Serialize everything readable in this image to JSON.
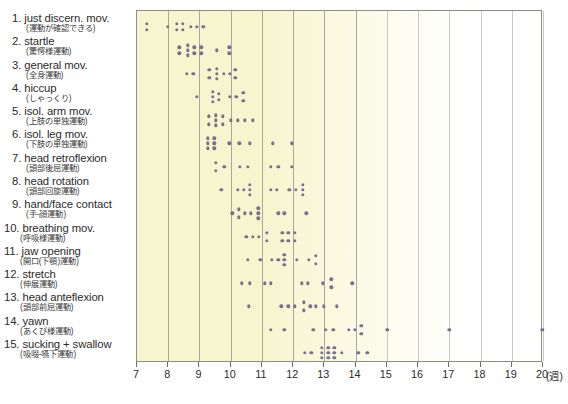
{
  "chart_data": {
    "type": "scatter",
    "title": "",
    "xlabel": "(週)",
    "ylabel": "",
    "xlim": [
      7,
      20
    ],
    "ylim": [
      0,
      16
    ],
    "grid": true,
    "legend": "none",
    "xticks": [
      7,
      8,
      9,
      10,
      11,
      12,
      13,
      14,
      15,
      16,
      17,
      18,
      19,
      20
    ],
    "x_unit_label": "(週)",
    "dot_color": "#7a6f8e",
    "plot_background": "#f7f5ce",
    "categories": [
      "1. just discern. mov.",
      "2. startle",
      "3. general mov.",
      "4. hiccup",
      "5. isol. arm mov.",
      "6. isol. leg mov.",
      "7. head retroflexion",
      "8. head rotation",
      "9. hand/face contact",
      "10. breathing mov.",
      "11. jaw opening",
      "12. stretch",
      "13. head anteflexion",
      "14. yawn",
      "15. sucking + swallow"
    ],
    "series": [
      {
        "name": "1. just discern. mov.",
        "jp": "(運動が確認できる)",
        "points": [
          {
            "x": 7.32,
            "o": -3
          },
          {
            "x": 7.32,
            "o": 3
          },
          {
            "x": 7.98,
            "o": 0
          },
          {
            "x": 8.28,
            "o": -3
          },
          {
            "x": 8.28,
            "o": 3
          },
          {
            "x": 8.47,
            "o": -3
          },
          {
            "x": 8.47,
            "o": 3
          },
          {
            "x": 8.72,
            "o": 0
          },
          {
            "x": 8.92,
            "o": 0
          },
          {
            "x": 9.12,
            "o": 0
          }
        ]
      },
      {
        "name": "2. startle",
        "jp": "(驚愕様運動)",
        "points": [
          {
            "x": 8.36,
            "o": -3
          },
          {
            "x": 8.36,
            "o": 3
          },
          {
            "x": 8.62,
            "o": -5
          },
          {
            "x": 8.62,
            "o": 0
          },
          {
            "x": 8.62,
            "o": 5
          },
          {
            "x": 8.84,
            "o": -3
          },
          {
            "x": 8.84,
            "o": 3
          },
          {
            "x": 9.06,
            "o": -3
          },
          {
            "x": 9.06,
            "o": 3
          },
          {
            "x": 9.55,
            "o": 0
          },
          {
            "x": 9.95,
            "o": -3
          },
          {
            "x": 9.95,
            "o": 3
          }
        ]
      },
      {
        "name": "3. general mov.",
        "jp": "(全身運動)",
        "points": [
          {
            "x": 8.6,
            "o": 0
          },
          {
            "x": 8.8,
            "o": 0
          },
          {
            "x": 9.32,
            "o": -4
          },
          {
            "x": 9.32,
            "o": 4
          },
          {
            "x": 9.55,
            "o": -5
          },
          {
            "x": 9.55,
            "o": 0
          },
          {
            "x": 9.55,
            "o": 5
          },
          {
            "x": 9.78,
            "o": 0
          },
          {
            "x": 9.98,
            "o": 0
          },
          {
            "x": 10.15,
            "o": -4
          },
          {
            "x": 10.15,
            "o": 4
          }
        ]
      },
      {
        "name": "4. hiccup",
        "jp": "(しゃっくり)",
        "points": [
          {
            "x": 8.92,
            "o": 0
          },
          {
            "x": 9.42,
            "o": -5
          },
          {
            "x": 9.42,
            "o": 0
          },
          {
            "x": 9.42,
            "o": 5
          },
          {
            "x": 9.62,
            "o": -3
          },
          {
            "x": 9.62,
            "o": 3
          },
          {
            "x": 9.98,
            "o": 0
          },
          {
            "x": 10.18,
            "o": 0
          },
          {
            "x": 10.4,
            "o": -4
          },
          {
            "x": 10.4,
            "o": 4
          }
        ]
      },
      {
        "name": "5. isol. arm mov.",
        "jp": "(上肢の単独運動)",
        "points": [
          {
            "x": 9.3,
            "o": -4
          },
          {
            "x": 9.3,
            "o": 4
          },
          {
            "x": 9.52,
            "o": -5
          },
          {
            "x": 9.52,
            "o": 0
          },
          {
            "x": 9.52,
            "o": 5
          },
          {
            "x": 9.74,
            "o": -4
          },
          {
            "x": 9.74,
            "o": 4
          },
          {
            "x": 10.0,
            "o": 0
          },
          {
            "x": 10.22,
            "o": 0
          },
          {
            "x": 10.46,
            "o": 0
          },
          {
            "x": 10.7,
            "o": 0
          }
        ]
      },
      {
        "name": "6. isol. leg mov.",
        "jp": "(下肢の単独運動)",
        "points": [
          {
            "x": 9.26,
            "o": -5
          },
          {
            "x": 9.26,
            "o": 0
          },
          {
            "x": 9.26,
            "o": 5
          },
          {
            "x": 9.48,
            "o": -5
          },
          {
            "x": 9.48,
            "o": 0
          },
          {
            "x": 9.48,
            "o": 5
          },
          {
            "x": 9.96,
            "o": 0
          },
          {
            "x": 10.28,
            "o": 0
          },
          {
            "x": 10.62,
            "o": 0
          },
          {
            "x": 11.35,
            "o": 0
          },
          {
            "x": 11.95,
            "o": 0
          }
        ]
      },
      {
        "name": "7. head retroflexion",
        "jp": "(頭部後屈運動)",
        "points": [
          {
            "x": 9.52,
            "o": -4
          },
          {
            "x": 9.52,
            "o": 4
          },
          {
            "x": 9.8,
            "o": 0
          },
          {
            "x": 10.3,
            "o": 0
          },
          {
            "x": 10.55,
            "o": 0
          },
          {
            "x": 11.28,
            "o": 0
          },
          {
            "x": 11.52,
            "o": 0
          },
          {
            "x": 11.95,
            "o": 0
          }
        ]
      },
      {
        "name": "8. head rotation",
        "jp": "(頭部回旋運動)",
        "points": [
          {
            "x": 9.7,
            "o": 0
          },
          {
            "x": 10.22,
            "o": 0
          },
          {
            "x": 10.42,
            "o": 0
          },
          {
            "x": 10.62,
            "o": -5
          },
          {
            "x": 10.62,
            "o": 0
          },
          {
            "x": 10.62,
            "o": 5
          },
          {
            "x": 11.28,
            "o": 0
          },
          {
            "x": 11.48,
            "o": 0
          },
          {
            "x": 11.88,
            "o": 0
          },
          {
            "x": 12.08,
            "o": 0
          },
          {
            "x": 12.3,
            "o": -5
          },
          {
            "x": 12.3,
            "o": 0
          },
          {
            "x": 12.3,
            "o": 5
          }
        ]
      },
      {
        "name": "9. hand/face contact",
        "jp": "(手-顔運動)",
        "points": [
          {
            "x": 10.05,
            "o": 0
          },
          {
            "x": 10.25,
            "o": -4
          },
          {
            "x": 10.25,
            "o": 4
          },
          {
            "x": 10.45,
            "o": 0
          },
          {
            "x": 10.65,
            "o": 0
          },
          {
            "x": 10.88,
            "o": -5
          },
          {
            "x": 10.88,
            "o": 0
          },
          {
            "x": 10.88,
            "o": 5
          },
          {
            "x": 11.52,
            "o": 0
          },
          {
            "x": 11.72,
            "o": 0
          },
          {
            "x": 12.42,
            "o": 0
          }
        ]
      },
      {
        "name": "10. breathing mov.",
        "jp": "(呼吸様運動)",
        "points": [
          {
            "x": 10.5,
            "o": 0
          },
          {
            "x": 10.7,
            "o": 0
          },
          {
            "x": 10.9,
            "o": 0
          },
          {
            "x": 11.15,
            "o": -4
          },
          {
            "x": 11.15,
            "o": 4
          },
          {
            "x": 11.65,
            "o": -4
          },
          {
            "x": 11.65,
            "o": 4
          },
          {
            "x": 11.85,
            "o": -4
          },
          {
            "x": 11.85,
            "o": 4
          },
          {
            "x": 12.05,
            "o": -4
          },
          {
            "x": 12.05,
            "o": 4
          }
        ]
      },
      {
        "name": "11. jaw opening",
        "jp": "(開口(下顎)運動)",
        "points": [
          {
            "x": 10.55,
            "o": 0
          },
          {
            "x": 10.95,
            "o": 0
          },
          {
            "x": 11.32,
            "o": 0
          },
          {
            "x": 11.52,
            "o": 0
          },
          {
            "x": 11.72,
            "o": -5
          },
          {
            "x": 11.72,
            "o": 0
          },
          {
            "x": 11.72,
            "o": 5
          },
          {
            "x": 12.12,
            "o": 0
          },
          {
            "x": 12.5,
            "o": 0
          },
          {
            "x": 12.72,
            "o": -4
          },
          {
            "x": 12.72,
            "o": 4
          }
        ]
      },
      {
        "name": "12. stretch",
        "jp": "(伸展運動)",
        "points": [
          {
            "x": 10.35,
            "o": 0
          },
          {
            "x": 10.62,
            "o": 0
          },
          {
            "x": 11.1,
            "o": 0
          },
          {
            "x": 11.28,
            "o": 0
          },
          {
            "x": 12.28,
            "o": 0
          },
          {
            "x": 12.46,
            "o": 0
          },
          {
            "x": 12.95,
            "o": 0
          },
          {
            "x": 13.22,
            "o": -4
          },
          {
            "x": 13.22,
            "o": 4
          },
          {
            "x": 13.9,
            "o": 0
          }
        ]
      },
      {
        "name": "13. head anteflexion",
        "jp": "(頭部前屈運動)",
        "points": [
          {
            "x": 10.58,
            "o": 0
          },
          {
            "x": 11.62,
            "o": 0
          },
          {
            "x": 11.85,
            "o": 0
          },
          {
            "x": 12.05,
            "o": 0
          },
          {
            "x": 12.35,
            "o": -4
          },
          {
            "x": 12.35,
            "o": 4
          },
          {
            "x": 12.55,
            "o": 0
          },
          {
            "x": 12.73,
            "o": 0
          },
          {
            "x": 12.98,
            "o": 0
          },
          {
            "x": 13.4,
            "o": 0
          }
        ]
      },
      {
        "name": "14. yawn",
        "jp": "(あくび様運動)",
        "points": [
          {
            "x": 11.28,
            "o": 0
          },
          {
            "x": 11.72,
            "o": 0
          },
          {
            "x": 12.65,
            "o": 0
          },
          {
            "x": 13.05,
            "o": 0
          },
          {
            "x": 13.28,
            "o": 0
          },
          {
            "x": 13.78,
            "o": 0
          },
          {
            "x": 13.98,
            "o": 0
          },
          {
            "x": 14.18,
            "o": -4
          },
          {
            "x": 14.18,
            "o": 4
          },
          {
            "x": 15.02,
            "o": 0
          },
          {
            "x": 17.0,
            "o": 0
          },
          {
            "x": 19.98,
            "o": 0
          }
        ]
      },
      {
        "name": "15. sucking + swallow",
        "jp": "(吸啜-嚥下運動)",
        "points": [
          {
            "x": 12.38,
            "o": 0
          },
          {
            "x": 12.58,
            "o": 0
          },
          {
            "x": 12.92,
            "o": -5
          },
          {
            "x": 12.92,
            "o": 0
          },
          {
            "x": 12.92,
            "o": 5
          },
          {
            "x": 13.12,
            "o": -5
          },
          {
            "x": 13.12,
            "o": 0
          },
          {
            "x": 13.12,
            "o": 5
          },
          {
            "x": 13.32,
            "o": -5
          },
          {
            "x": 13.32,
            "o": 0
          },
          {
            "x": 13.32,
            "o": 5
          },
          {
            "x": 13.55,
            "o": 0
          },
          {
            "x": 14.08,
            "o": 0
          },
          {
            "x": 14.38,
            "o": 0
          }
        ]
      }
    ]
  },
  "caption": ""
}
